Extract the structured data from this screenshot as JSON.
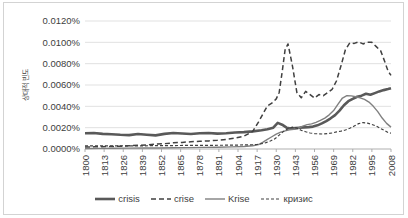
{
  "chart_data": {
    "type": "line",
    "title": "",
    "xlabel": "",
    "ylabel": "상대적 빈도",
    "ylim": [
      0,
      0.012
    ],
    "xlim": [
      1800,
      2008
    ],
    "grid": true,
    "legend_position": "bottom",
    "y_ticks": [
      "0.0000%",
      "0.0020%",
      "0.0040%",
      "0.0060%",
      "0.0080%",
      "0.0100%",
      "0.0120%"
    ],
    "y_tick_values": [
      0.0,
      0.002,
      0.004,
      0.006,
      0.008,
      0.01,
      0.012
    ],
    "x_ticks": [
      "1800",
      "1813",
      "1826",
      "1839",
      "1852",
      "1865",
      "1878",
      "1891",
      "1904",
      "1917",
      "1930",
      "1943",
      "1956",
      "1969",
      "1982",
      "1995",
      "2008"
    ],
    "x_tick_values": [
      1800,
      1813,
      1826,
      1839,
      1852,
      1865,
      1878,
      1891,
      1904,
      1917,
      1930,
      1943,
      1956,
      1969,
      1982,
      1995,
      2008
    ],
    "series": [
      {
        "name": "crisis",
        "color": "#595959",
        "width": 2.6,
        "dash": "none",
        "x": [
          1800,
          1806,
          1812,
          1818,
          1824,
          1830,
          1836,
          1842,
          1848,
          1854,
          1860,
          1866,
          1872,
          1878,
          1884,
          1890,
          1896,
          1902,
          1908,
          1914,
          1920,
          1924,
          1928,
          1931,
          1934,
          1937,
          1940,
          1943,
          1946,
          1949,
          1952,
          1955,
          1958,
          1961,
          1964,
          1967,
          1970,
          1973,
          1976,
          1979,
          1982,
          1985,
          1988,
          1991,
          1994,
          1997,
          2000,
          2003,
          2006,
          2008
        ],
        "values": [
          0.00148,
          0.0015,
          0.00142,
          0.00138,
          0.00133,
          0.0013,
          0.0014,
          0.00134,
          0.00128,
          0.00142,
          0.0015,
          0.00146,
          0.0014,
          0.00148,
          0.0015,
          0.00144,
          0.00148,
          0.00155,
          0.00158,
          0.00165,
          0.00175,
          0.00185,
          0.002,
          0.00245,
          0.00228,
          0.002,
          0.00192,
          0.00196,
          0.002,
          0.00203,
          0.00205,
          0.0021,
          0.00222,
          0.0024,
          0.00262,
          0.00288,
          0.00318,
          0.0036,
          0.0041,
          0.00448,
          0.0047,
          0.0049,
          0.005,
          0.00518,
          0.00508,
          0.00524,
          0.0054,
          0.00552,
          0.00562,
          0.0057
        ]
      },
      {
        "name": "crise",
        "color": "#404040",
        "width": 1.5,
        "dash": "5,3",
        "x": [
          1800,
          1806,
          1812,
          1818,
          1824,
          1830,
          1836,
          1842,
          1848,
          1854,
          1860,
          1866,
          1872,
          1878,
          1884,
          1890,
          1896,
          1902,
          1908,
          1914,
          1918,
          1921,
          1924,
          1927,
          1930,
          1932,
          1934,
          1936,
          1938,
          1941,
          1944,
          1947,
          1950,
          1953,
          1956,
          1959,
          1962,
          1965,
          1968,
          1971,
          1974,
          1977,
          1980,
          1983,
          1986,
          1989,
          1992,
          1995,
          1998,
          2001,
          2004,
          2006,
          2008
        ],
        "values": [
          0.00018,
          0.0002,
          0.00022,
          0.00024,
          0.00026,
          0.0003,
          0.00035,
          0.00038,
          0.00045,
          0.0005,
          0.00058,
          0.00062,
          0.00068,
          0.00072,
          0.00076,
          0.00082,
          0.0009,
          0.00102,
          0.0012,
          0.00165,
          0.00255,
          0.0033,
          0.00405,
          0.0043,
          0.0047,
          0.0053,
          0.0072,
          0.0093,
          0.00985,
          0.0078,
          0.0053,
          0.0048,
          0.0054,
          0.0051,
          0.00478,
          0.0051,
          0.005,
          0.0053,
          0.0056,
          0.0064,
          0.0078,
          0.0093,
          0.00995,
          0.0099,
          0.01005,
          0.00985,
          0.01,
          0.01,
          0.0096,
          0.0092,
          0.0081,
          0.0073,
          0.0069
        ]
      },
      {
        "name": "Krise",
        "color": "#808080",
        "width": 1.4,
        "dash": "none",
        "x": [
          1800,
          1810,
          1820,
          1830,
          1840,
          1850,
          1860,
          1870,
          1880,
          1890,
          1900,
          1908,
          1914,
          1918,
          1921,
          1924,
          1927,
          1930,
          1933,
          1936,
          1939,
          1942,
          1945,
          1948,
          1951,
          1954,
          1957,
          1960,
          1963,
          1966,
          1969,
          1972,
          1975,
          1978,
          1981,
          1984,
          1987,
          1990,
          1993,
          1996,
          1999,
          2002,
          2005,
          2008
        ],
        "values": [
          5e-05,
          6e-05,
          7e-05,
          8e-05,
          9e-05,
          0.0001,
          0.00012,
          0.00013,
          0.00015,
          0.00017,
          0.0002,
          0.00024,
          0.0003,
          0.00042,
          0.00065,
          0.0009,
          0.00115,
          0.0014,
          0.00158,
          0.0017,
          0.0018,
          0.00185,
          0.00195,
          0.00215,
          0.00228,
          0.00235,
          0.0025,
          0.00268,
          0.0029,
          0.0032,
          0.0036,
          0.0042,
          0.00478,
          0.005,
          0.00498,
          0.0049,
          0.0048,
          0.00465,
          0.0044,
          0.004,
          0.0035,
          0.0029,
          0.0024,
          0.00205
        ]
      },
      {
        "name": "кризис",
        "color": "#404040",
        "width": 1.2,
        "dash": "3,2",
        "x": [
          1800,
          1810,
          1820,
          1830,
          1840,
          1850,
          1860,
          1870,
          1880,
          1890,
          1900,
          1908,
          1914,
          1917,
          1920,
          1923,
          1926,
          1929,
          1932,
          1935,
          1938,
          1941,
          1944,
          1947,
          1950,
          1953,
          1956,
          1959,
          1962,
          1965,
          1968,
          1971,
          1974,
          1977,
          1980,
          1983,
          1986,
          1989,
          1992,
          1995,
          1998,
          2001,
          2004,
          2006,
          2008
        ],
        "values": [
          0.0003,
          0.0003,
          0.0003,
          0.0003,
          0.0003,
          0.00032,
          0.00032,
          0.00034,
          0.00034,
          0.00035,
          0.00036,
          0.00038,
          0.0004,
          0.00042,
          0.0005,
          0.0006,
          0.00075,
          0.00095,
          0.0013,
          0.00165,
          0.0019,
          0.00205,
          0.00195,
          0.00175,
          0.00162,
          0.0015,
          0.00145,
          0.00142,
          0.0014,
          0.00145,
          0.0015,
          0.0016,
          0.00168,
          0.00178,
          0.00195,
          0.00215,
          0.00238,
          0.00248,
          0.00242,
          0.0023,
          0.00215,
          0.00192,
          0.0017,
          0.00155,
          0.00148
        ]
      }
    ]
  },
  "legend": {
    "items": [
      {
        "label": "crisis"
      },
      {
        "label": "crise"
      },
      {
        "label": "Krise"
      },
      {
        "label": "кризис"
      }
    ]
  }
}
